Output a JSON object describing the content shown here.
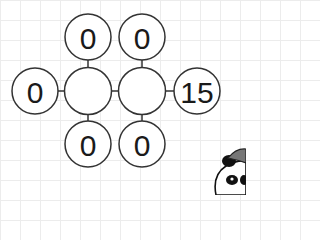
{
  "puzzle": {
    "center_nodes": [
      {
        "id": "center-left",
        "value": ""
      },
      {
        "id": "center-right",
        "value": ""
      }
    ],
    "outer_nodes": {
      "top_left": "0",
      "top_right": "0",
      "left": "0",
      "right": "15",
      "bottom_left": "0",
      "bottom_right": "0"
    }
  },
  "mascot": {
    "icon": "panda-mascot-icon"
  },
  "colors": {
    "stroke": "#333333",
    "grid": "#ececec",
    "background": "#ffffff"
  }
}
